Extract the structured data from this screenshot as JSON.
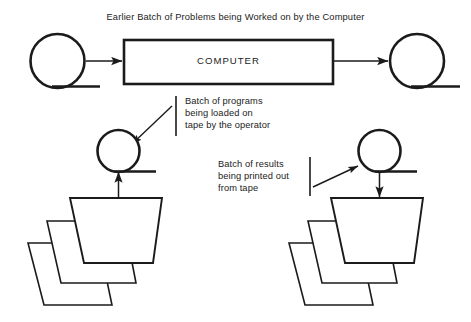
{
  "diagram": {
    "title": "Earlier Batch of Problems being Worked on by the Computer",
    "computer_label": "COMPUTER",
    "annotations": {
      "loading": "Batch of programs\nbeing loaded on\ntape by the operator",
      "printing": "Batch of results\nbeing printed out\nfrom tape"
    },
    "icon_names": {
      "tape_reel": "tape-reel-icon",
      "card_deck": "card-deck-icon",
      "flow_arrow": "flow-arrow-icon",
      "leader_arrow": "leader-arrow-icon",
      "bracket": "annotation-bracket-icon"
    },
    "colors": {
      "stroke": "#1b1b1b",
      "background": "#ffffff",
      "text": "#1b1b1b"
    }
  }
}
